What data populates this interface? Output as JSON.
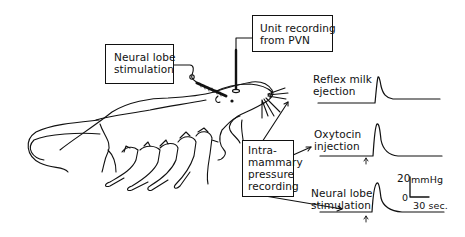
{
  "figure": {
    "boxes": {
      "neural_lobe_stim": {
        "line1": "Neural lobe",
        "line2": "stimulation"
      },
      "unit_recording": {
        "line1": "Unit recording",
        "line2": "from PVN"
      },
      "intramammary": {
        "line1": "Intra-",
        "line2": "mammary",
        "line3": "pressure",
        "line4": "recording"
      }
    },
    "traces": [
      {
        "label1": "Reflex milk",
        "label2": "ejection",
        "stimulus_marker": false
      },
      {
        "label1": "Oxytocin",
        "label2": "injection",
        "stimulus_marker": true
      },
      {
        "label1": "Neural lobe",
        "label2": "stimulation",
        "stimulus_marker": true
      }
    ],
    "scale_bar": {
      "y_value": "20",
      "y_unit": "mmHg",
      "y_zero": "0",
      "x_label": "30 sec."
    },
    "subjects": {
      "adult": "lactating rat",
      "pups": 5
    },
    "colors": {
      "ink": "#111111",
      "background": "#ffffff"
    }
  }
}
